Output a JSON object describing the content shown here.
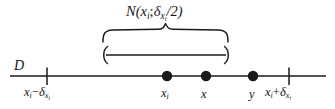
{
  "figure": {
    "type": "number-line-diagram",
    "background_color": "#ffffff",
    "ink_color": "#1a1a1a",
    "labels": {
      "domain": "D",
      "set_label_prefix": "N(",
      "set_label_center": "x",
      "set_label_center_sub": "i",
      "set_label_semicolon": ";",
      "set_label_delta": "δ",
      "set_label_delta_sub": "x",
      "set_label_delta_subsub": "i",
      "set_label_suffix": "/2)",
      "set_label_plain": "N(x_i; δ_{x_i}/2)",
      "left_tick_var": "x",
      "left_tick_var_sub": "i",
      "left_tick_minus": "−",
      "left_tick_delta": "δ",
      "left_tick_delta_sub": "x",
      "left_tick_delta_subsub": "i",
      "left_tick_plain": "x_i − δ_{x_i}",
      "right_tick_var": "x",
      "right_tick_var_sub": "i",
      "right_tick_plus": "+",
      "right_tick_delta": "δ",
      "right_tick_delta_sub": "x",
      "right_tick_delta_subsub": "i",
      "right_tick_plain": "x_i + δ_{x_i}",
      "point_xi": "x",
      "point_xi_sub": "i",
      "point_x": "x",
      "point_y": "y"
    },
    "geometry": {
      "axis_y": 76,
      "axis_x_start": 10,
      "axis_x_end": 326,
      "tick_left_x": 47,
      "tick_right_x": 289,
      "tick_half_height": 8,
      "point_xi_x": 167,
      "point_x_x": 206,
      "point_y_x": 253,
      "point_radius": 5.2,
      "brace_left_x": 103,
      "brace_right_x": 228,
      "brace_top_y": 29,
      "brace_peak_y": 23,
      "interval_y": 55,
      "interval_left_x": 104,
      "interval_right_x": 227
    }
  }
}
